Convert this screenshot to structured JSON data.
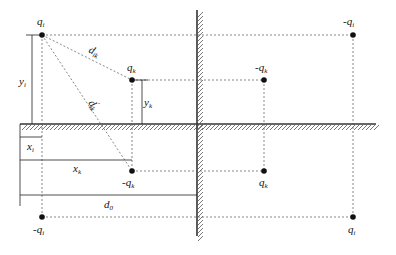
{
  "diagram": {
    "type": "image-charge method for two orthogonal grounded walls",
    "colors": {
      "line": "#222222",
      "dashed": "#555555",
      "background": "#ffffff"
    },
    "charges": [
      {
        "id": "qi",
        "label": "q",
        "sub": "i",
        "x": 42,
        "y": 35,
        "label_pos": "above"
      },
      {
        "id": "qk",
        "label": "q",
        "sub": "k",
        "x": 132,
        "y": 80,
        "label_pos": "above"
      },
      {
        "id": "img-qi-right-top",
        "label": "-q",
        "sub": "i",
        "x": 353,
        "y": 35,
        "label_pos": "above"
      },
      {
        "id": "img-qk-right-top",
        "label": "-q",
        "sub": "k",
        "x": 264,
        "y": 80,
        "label_pos": "above"
      },
      {
        "id": "img-qk-left-bottom",
        "label": "-q",
        "sub": "k",
        "x": 132,
        "y": 171,
        "label_pos": "below"
      },
      {
        "id": "img-qk-right-bottom",
        "label": "q",
        "sub": "k",
        "x": 264,
        "y": 171,
        "label_pos": "below"
      },
      {
        "id": "img-qi-left-bottom",
        "label": "-q",
        "sub": "i",
        "x": 42,
        "y": 217,
        "label_pos": "below"
      },
      {
        "id": "img-qi-right-bottom",
        "label": "q",
        "sub": "i",
        "x": 353,
        "y": 217,
        "label_pos": "below"
      }
    ],
    "distances": [
      {
        "label": "d",
        "sub": "ik",
        "prime": false
      },
      {
        "label": "d",
        "sub": "ik",
        "prime": true
      }
    ],
    "dimensions": {
      "yi": {
        "label": "y",
        "sub": "i"
      },
      "yk": {
        "label": "y",
        "sub": "k"
      },
      "xi": {
        "label": "x",
        "sub": "i"
      },
      "xk": {
        "label": "x",
        "sub": "k"
      },
      "d0": {
        "label": "d",
        "sub": "0"
      }
    }
  }
}
